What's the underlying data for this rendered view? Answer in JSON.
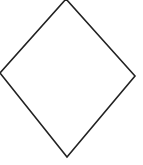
{
  "diagram": {
    "shape": "diamond",
    "fill": "#ffffff",
    "stroke": "#222222",
    "stroke_width": 1.6,
    "points": "66,-1 135,76 67,157 0,73"
  }
}
